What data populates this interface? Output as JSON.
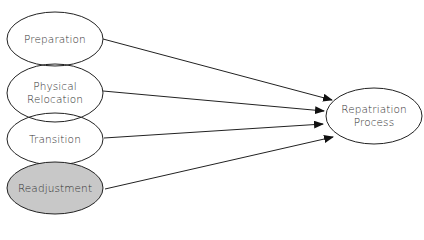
{
  "diagram": {
    "type": "flow",
    "colors": {
      "stroke": "#222222",
      "fill": "#ffffff",
      "highlight_fill": "#c8c8c8",
      "text": "#333333"
    },
    "nodes": [
      {
        "id": "preparation",
        "label_lines": [
          "Preparation"
        ],
        "highlighted": false
      },
      {
        "id": "physical_relocation",
        "label_lines": [
          "Physical",
          "Relocation"
        ],
        "highlighted": false
      },
      {
        "id": "transition",
        "label_lines": [
          "Transition"
        ],
        "highlighted": false
      },
      {
        "id": "readjustment",
        "label_lines": [
          "Readjustment"
        ],
        "highlighted": true
      },
      {
        "id": "repatriation_process",
        "label_lines": [
          "Repatriation",
          "Process"
        ],
        "highlighted": false
      }
    ],
    "edges": [
      {
        "from": "preparation",
        "to": "repatriation_process"
      },
      {
        "from": "physical_relocation",
        "to": "repatriation_process"
      },
      {
        "from": "transition",
        "to": "repatriation_process"
      },
      {
        "from": "readjustment",
        "to": "repatriation_process"
      }
    ]
  }
}
